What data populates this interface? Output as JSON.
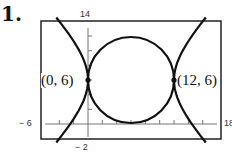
{
  "problem_number": "1.",
  "chart_data": {
    "type": "line",
    "title": "",
    "xlabel": "",
    "ylabel": "",
    "xlim": [
      -6,
      18
    ],
    "ylim": [
      -2,
      14
    ],
    "x_tick_step": 2,
    "y_tick_step": 2,
    "window_labels": {
      "xmin": "− 6",
      "xmax": "18",
      "ymin": "− 2",
      "ymax": "14"
    },
    "grid": false,
    "legend": null,
    "series": [
      {
        "name": "circle",
        "kind": "circle",
        "center": [
          6,
          6
        ],
        "radius": 6
      },
      {
        "name": "hyperbola",
        "kind": "hyperbola",
        "center": [
          6,
          6
        ],
        "a": 6,
        "b": 6,
        "orientation": "horizontal"
      }
    ],
    "annotations": [
      {
        "label": "(0, 6)",
        "x": 0,
        "y": 6
      },
      {
        "label": "(12, 6)",
        "x": 12,
        "y": 6
      }
    ]
  },
  "color": {
    "curve": "#111111",
    "frame": "#222222",
    "axis": "#666666"
  }
}
